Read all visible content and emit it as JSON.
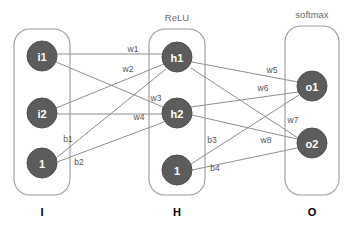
{
  "diagram": {
    "canvas": {
      "width": 355,
      "height": 229
    },
    "colors": {
      "node_fill": "#5c5c5c",
      "node_text": "#ffffff",
      "edge": "#8d8d8d",
      "box_stroke": "#9a9a9a",
      "label_text": "#555555",
      "layer_name": "#000000",
      "activation_text": "#6b6b6b",
      "background": "#ffffff"
    }
  },
  "layers": [
    {
      "id": "input",
      "name": "I",
      "activation": "",
      "box": {
        "x": 14,
        "y": 29,
        "width": 56,
        "height": 166,
        "rx": 16
      },
      "name_pos": {
        "x": 42,
        "y": 212
      },
      "nodes": [
        {
          "id": "i1",
          "label": "i1",
          "cx": 42,
          "cy": 56,
          "r": 15
        },
        {
          "id": "i2",
          "label": "i2",
          "cx": 42,
          "cy": 113,
          "r": 15
        },
        {
          "id": "ib",
          "label": "1",
          "cx": 42,
          "cy": 163,
          "r": 15
        }
      ]
    },
    {
      "id": "hidden",
      "name": "H",
      "activation": "ReLU",
      "activation_pos": {
        "x": 177,
        "y": 17
      },
      "box": {
        "x": 149,
        "y": 29,
        "width": 56,
        "height": 166,
        "rx": 16
      },
      "name_pos": {
        "x": 177,
        "y": 212
      },
      "nodes": [
        {
          "id": "h1",
          "label": "h1",
          "cx": 177,
          "cy": 57,
          "r": 15
        },
        {
          "id": "h2",
          "label": "h2",
          "cx": 177,
          "cy": 113,
          "r": 15
        },
        {
          "id": "hb",
          "label": "1",
          "cx": 177,
          "cy": 170,
          "r": 15
        }
      ]
    },
    {
      "id": "output",
      "name": "O",
      "activation": "softmax",
      "activation_pos": {
        "x": 312,
        "y": 14
      },
      "box": {
        "x": 285,
        "y": 26,
        "width": 54,
        "height": 169,
        "rx": 16
      },
      "name_pos": {
        "x": 312,
        "y": 212
      },
      "nodes": [
        {
          "id": "o1",
          "label": "o1",
          "cx": 312,
          "cy": 86,
          "r": 15
        },
        {
          "id": "o2",
          "label": "o2",
          "cx": 312,
          "cy": 143,
          "r": 15
        }
      ]
    }
  ],
  "edges": [
    {
      "id": "e-w1",
      "label": "w1",
      "from": "i1",
      "to": "h1",
      "x1": 57,
      "y1": 54,
      "x2": 162,
      "y2": 54,
      "lx": 133,
      "ly": 49
    },
    {
      "id": "e-w2",
      "label": "w2",
      "from": "i1",
      "to": "h2",
      "x1": 56,
      "y1": 62,
      "x2": 163,
      "y2": 107,
      "lx": 128,
      "ly": 69
    },
    {
      "id": "e-w3",
      "label": "w3",
      "from": "i2",
      "to": "h1",
      "x1": 56,
      "y1": 108,
      "x2": 164,
      "y2": 64,
      "lx": 156,
      "ly": 98
    },
    {
      "id": "e-w4",
      "label": "w4",
      "from": "i2",
      "to": "h2",
      "x1": 57,
      "y1": 114,
      "x2": 162,
      "y2": 114,
      "lx": 139,
      "ly": 117
    },
    {
      "id": "e-b1",
      "label": "b1",
      "from": "ib",
      "to": "h1",
      "x1": 56,
      "y1": 158,
      "x2": 166,
      "y2": 69,
      "lx": 68,
      "ly": 139
    },
    {
      "id": "e-b2",
      "label": "b2",
      "from": "ib",
      "to": "h2",
      "x1": 57,
      "y1": 162,
      "x2": 164,
      "y2": 122,
      "lx": 79,
      "ly": 162
    },
    {
      "id": "e-w5",
      "label": "w5",
      "from": "h1",
      "to": "o1",
      "x1": 192,
      "y1": 62,
      "x2": 298,
      "y2": 82,
      "lx": 272,
      "ly": 70
    },
    {
      "id": "e-w6",
      "label": "w6",
      "from": "h1",
      "to": "o2",
      "x1": 191,
      "y1": 68,
      "x2": 298,
      "y2": 138,
      "lx": 263,
      "ly": 88
    },
    {
      "id": "e-w7",
      "label": "w7",
      "from": "h2",
      "to": "o1",
      "x1": 191,
      "y1": 107,
      "x2": 298,
      "y2": 92,
      "lx": 293,
      "ly": 120
    },
    {
      "id": "e-w8",
      "label": "w8",
      "from": "h2",
      "to": "o2",
      "x1": 192,
      "y1": 115,
      "x2": 297,
      "y2": 139,
      "lx": 266,
      "ly": 140
    },
    {
      "id": "e-b3",
      "label": "b3",
      "from": "hb",
      "to": "o1",
      "x1": 191,
      "y1": 164,
      "x2": 299,
      "y2": 95,
      "lx": 212,
      "ly": 140
    },
    {
      "id": "e-b4",
      "label": "b4",
      "from": "hb",
      "to": "o2",
      "x1": 192,
      "y1": 170,
      "x2": 297,
      "y2": 148,
      "lx": 215,
      "ly": 168
    }
  ]
}
